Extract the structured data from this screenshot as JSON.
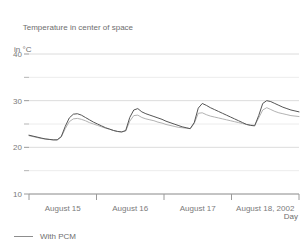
{
  "chart_data": {
    "type": "line",
    "title": "Temperature in center of space",
    "subtitle": "in °C",
    "ylabel": "in °C",
    "xlabel": "Day",
    "ylim": [
      10,
      40
    ],
    "yticks": [
      10,
      20,
      30,
      40
    ],
    "yticks_minor": [
      15,
      25,
      35
    ],
    "ytick_labels": [
      "10",
      "20",
      "30",
      "40"
    ],
    "grid": true,
    "legend_position": "below-left",
    "xtick_labels": [
      "August 15",
      "August 16",
      "August 17",
      "August 18, 2002"
    ],
    "legend": [
      {
        "name": "With PCM",
        "color": "#8d8d8d"
      }
    ],
    "series": [
      {
        "name": "Without PCM",
        "color": "#585858",
        "x": [
          0.0,
          0.02,
          0.05,
          0.08,
          0.11,
          0.14,
          0.17,
          0.2,
          0.23,
          0.26,
          0.29,
          0.32,
          0.35,
          0.38,
          0.41,
          0.44,
          0.47,
          0.5,
          0.53,
          0.56,
          0.59,
          0.62,
          0.65,
          0.68,
          0.71,
          0.74,
          0.77,
          0.8,
          0.83,
          0.86,
          0.89,
          0.92,
          0.95,
          0.98,
          1.0
        ],
        "values": [
          22.6,
          22.4,
          22.2,
          22.0,
          21.8,
          21.7,
          21.6,
          21.6,
          22.2,
          24.2,
          26.0,
          26.9,
          27.1,
          26.9,
          26.5,
          26.1,
          25.7,
          25.3,
          24.9,
          24.5,
          24.1,
          23.8,
          23.5,
          23.3,
          23.2,
          25.6,
          27.6,
          28.2,
          27.6,
          27.2,
          26.9,
          26.6,
          26.3,
          26.0,
          25.7
        ]
      },
      {
        "name": "With PCM",
        "color": "#a8a8a8",
        "x": [
          0.0,
          0.02,
          0.05,
          0.08,
          0.11,
          0.14,
          0.17,
          0.2,
          0.23,
          0.26,
          0.29,
          0.32,
          0.35,
          0.38,
          0.41,
          0.44,
          0.47,
          0.5,
          0.53,
          0.56,
          0.59,
          0.62,
          0.65,
          0.68,
          0.71,
          0.74,
          0.77,
          0.8,
          0.83,
          0.86,
          0.89,
          0.92,
          0.95,
          0.98,
          1.0
        ],
        "values": [
          22.5,
          22.3,
          22.1,
          21.9,
          21.8,
          21.7,
          21.6,
          21.6,
          22.1,
          23.8,
          25.3,
          26.0,
          26.2,
          26.0,
          25.7,
          25.4,
          25.1,
          24.8,
          24.5,
          24.2,
          23.9,
          23.7,
          23.5,
          23.3,
          23.2,
          25.0,
          26.6,
          26.8,
          26.3,
          26.0,
          25.8,
          25.6,
          25.4,
          25.2,
          25.0
        ]
      }
    ],
    "full_series": {
      "without_pcm": [
        22.6,
        22.4,
        22.2,
        22.0,
        21.8,
        21.7,
        21.6,
        21.6,
        22.3,
        24.5,
        26.3,
        27.1,
        27.2,
        26.9,
        26.4,
        25.9,
        25.4,
        25.0,
        24.6,
        24.2,
        23.9,
        23.6,
        23.4,
        23.3,
        23.6,
        26.4,
        28.0,
        28.3,
        27.6,
        27.2,
        26.9,
        26.6,
        26.3,
        26.0,
        25.6,
        25.3,
        25.0,
        24.7,
        24.4,
        24.2,
        24.0,
        25.3,
        28.4,
        29.4,
        29.0,
        28.5,
        28.1,
        27.7,
        27.3,
        26.9,
        26.5,
        26.1,
        25.7,
        25.3,
        24.9,
        24.7,
        24.6,
        26.8,
        29.4,
        30.0,
        29.8,
        29.4,
        29.0,
        28.6,
        28.3,
        28.0,
        27.8,
        27.6
      ],
      "with_pcm": [
        22.5,
        22.3,
        22.1,
        21.9,
        21.8,
        21.7,
        21.6,
        21.6,
        22.2,
        24.0,
        25.5,
        26.1,
        26.2,
        26.0,
        25.7,
        25.3,
        25.0,
        24.7,
        24.4,
        24.1,
        23.9,
        23.6,
        23.4,
        23.3,
        23.5,
        25.6,
        26.8,
        26.9,
        26.4,
        26.1,
        25.9,
        25.7,
        25.4,
        25.2,
        24.9,
        24.7,
        24.5,
        24.3,
        24.2,
        24.1,
        24.0,
        25.1,
        27.3,
        27.4,
        27.0,
        26.7,
        26.5,
        26.3,
        26.1,
        25.9,
        25.7,
        25.5,
        25.3,
        25.1,
        24.9,
        24.8,
        24.7,
        26.3,
        28.0,
        28.5,
        28.1,
        27.7,
        27.4,
        27.2,
        27.0,
        26.8,
        26.7,
        26.6
      ]
    }
  }
}
